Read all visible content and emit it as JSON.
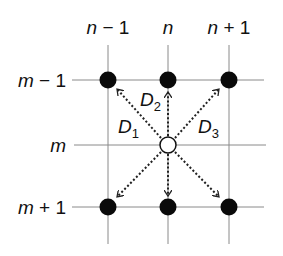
{
  "diagram": {
    "type": "grid-neighborhood",
    "column_labels": [
      {
        "var": "n",
        "suffix": " − 1"
      },
      {
        "var": "n",
        "suffix": ""
      },
      {
        "var": "n",
        "suffix": " + 1"
      }
    ],
    "row_labels": [
      {
        "var": "m",
        "suffix": " − 1"
      },
      {
        "var": "m",
        "suffix": ""
      },
      {
        "var": "m",
        "suffix": " + 1"
      }
    ],
    "center_node": {
      "row": "m",
      "col": "n",
      "style": "open"
    },
    "neighbor_nodes": [
      {
        "row": "m − 1",
        "col": "n − 1",
        "style": "filled"
      },
      {
        "row": "m − 1",
        "col": "n",
        "style": "filled"
      },
      {
        "row": "m − 1",
        "col": "n + 1",
        "style": "filled"
      },
      {
        "row": "m + 1",
        "col": "n − 1",
        "style": "filled"
      },
      {
        "row": "m + 1",
        "col": "n",
        "style": "filled"
      },
      {
        "row": "m + 1",
        "col": "n + 1",
        "style": "filled"
      }
    ],
    "direction_labels": [
      {
        "letter": "D",
        "sub": "1"
      },
      {
        "letter": "D",
        "sub": "2"
      },
      {
        "letter": "D",
        "sub": "3"
      }
    ],
    "arrow_style": "dotted",
    "colors": {
      "grid": "#8a8a8a",
      "node": "#0a0a0a",
      "arrow": "#222222",
      "text": "#111111"
    }
  }
}
